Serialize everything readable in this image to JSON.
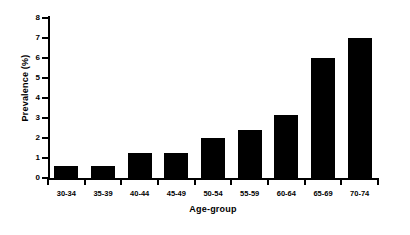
{
  "chart_data": {
    "type": "bar",
    "title": "",
    "subtitle": "",
    "xlabel": "Age-group",
    "ylabel": "Prevalence (%)",
    "categories": [
      "30-34",
      "35-39",
      "40-44",
      "45-49",
      "50-54",
      "55-59",
      "60-64",
      "65-69",
      "70-74"
    ],
    "values": [
      0.6,
      0.6,
      1.25,
      1.25,
      2.0,
      2.4,
      3.15,
      6.0,
      7.0
    ],
    "ylim": [
      0,
      8
    ],
    "yticks": [
      0,
      1,
      2,
      3,
      4,
      5,
      6,
      7,
      8
    ],
    "ytick_labels": [
      "0",
      "1",
      "2",
      "3",
      "4",
      "5",
      "6",
      "7",
      "8"
    ],
    "grid": false,
    "legend": null,
    "legend_position": "none",
    "bar_color": "#000000",
    "background_color": "#ffffff",
    "axis_color": "#000000",
    "annotations": []
  }
}
